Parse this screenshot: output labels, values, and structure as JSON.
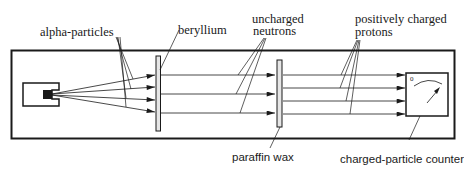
{
  "diagram": {
    "colors": {
      "ink": "#1a1a1a",
      "background": "#ffffff",
      "plate_fill": "#e6e6e6"
    },
    "labels": {
      "alpha_particles": "alpha-particles",
      "beryllium": "beryllium",
      "uncharged_neutrons_line1": "uncharged",
      "uncharged_neutrons_line2": "neutrons",
      "protons_line1": "positively charged",
      "protons_line2": "protons",
      "paraffin_wax": "paraffin wax",
      "counter": "charged-particle counter",
      "counter_scale_zero": "0"
    },
    "components": [
      {
        "id": "alpha-source",
        "label": "alpha source (polonium)"
      },
      {
        "id": "beryllium-plate",
        "label": "beryllium"
      },
      {
        "id": "paraffin-plate",
        "label": "paraffin wax"
      },
      {
        "id": "counter",
        "label": "charged-particle counter"
      }
    ],
    "beams": [
      {
        "name": "alpha-particles",
        "count": 4
      },
      {
        "name": "uncharged neutrons",
        "count": 3
      },
      {
        "name": "positively charged protons",
        "count": 4
      }
    ]
  }
}
